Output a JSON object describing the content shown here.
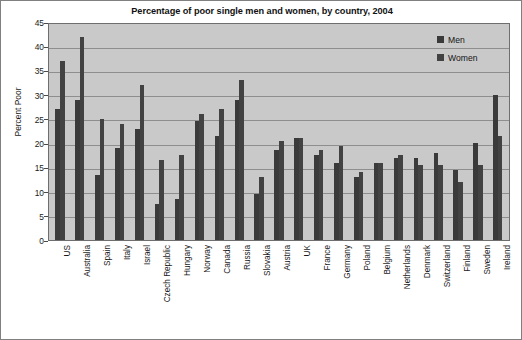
{
  "chart_data": {
    "type": "bar",
    "title": "Percentage of poor single men and women, by country, 2004",
    "xlabel": "",
    "ylabel": "Percent Poor",
    "ylim": [
      0,
      45
    ],
    "ytick_step": 5,
    "yticks": [
      "45",
      "40",
      "35",
      "30",
      "25",
      "20",
      "15",
      "10",
      "5",
      "0"
    ],
    "grid": true,
    "legend_position": "top-right",
    "categories": [
      "US",
      "Australia",
      "Spain",
      "Italy",
      "Israel",
      "Czech Republic",
      "Hungary",
      "Norway",
      "Canada",
      "Russia",
      "Slovakia",
      "Austria",
      "UK",
      "France",
      "Germany",
      "Poland",
      "Belgium",
      "Netherlands",
      "Denmark",
      "Switzerland",
      "Finland",
      "Sweden",
      "Ireland"
    ],
    "series": [
      {
        "name": "Men",
        "color": "#3a3a3a",
        "values": [
          27,
          29,
          13.5,
          19,
          23,
          7.5,
          8.5,
          24.5,
          21.5,
          29,
          9.5,
          18.5,
          21,
          17.5,
          16,
          13,
          16,
          17,
          17,
          18,
          14.5,
          20,
          30
        ]
      },
      {
        "name": "Women",
        "color": "#424242",
        "values": [
          37,
          42,
          25,
          24,
          32,
          16.5,
          17.5,
          26,
          27,
          33,
          13,
          20.5,
          21,
          18.5,
          19.5,
          14,
          16,
          17.5,
          15.5,
          15.5,
          12,
          15.5,
          21.5
        ]
      }
    ]
  },
  "legend": {
    "items": [
      {
        "label": "Men"
      },
      {
        "label": "Women"
      }
    ]
  }
}
